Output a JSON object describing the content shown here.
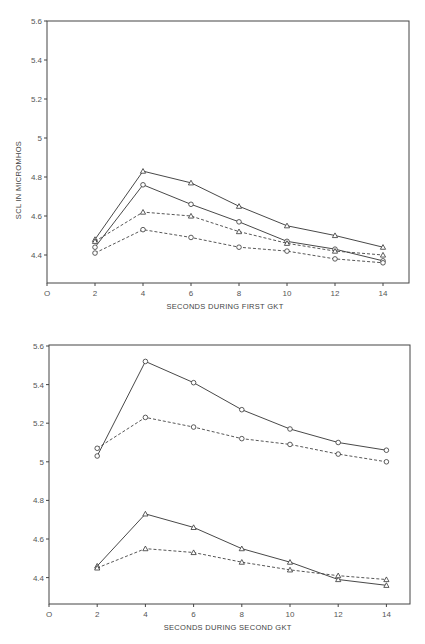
{
  "chart_data": [
    {
      "type": "line",
      "title": "",
      "xlabel": "SECONDS DURING FIRST GKT",
      "ylabel": "SCL IN MICROMHOS",
      "x": [
        2,
        4,
        6,
        8,
        10,
        12,
        14
      ],
      "xticks": [
        0,
        2,
        4,
        6,
        8,
        10,
        12,
        14
      ],
      "xtick_labels": [
        "O",
        "2",
        "4",
        "6",
        "8",
        "10",
        "12",
        "14"
      ],
      "yticks": [
        4.4,
        4.6,
        4.8,
        5.0,
        5.2,
        5.4,
        5.6
      ],
      "ytick_labels": [
        "4.4",
        "4.6",
        "4.8",
        "5",
        "5.2",
        "5.4",
        "5.6"
      ],
      "xlim": [
        0,
        15
      ],
      "ylim": [
        4.26,
        5.6
      ],
      "grid": false,
      "legend": null,
      "series": [
        {
          "name": "solid-triangle",
          "line": "solid",
          "marker": "triangle",
          "values": [
            4.48,
            4.83,
            4.77,
            4.65,
            4.55,
            4.5,
            4.44
          ]
        },
        {
          "name": "solid-circle",
          "line": "solid",
          "marker": "circle",
          "values": [
            4.44,
            4.76,
            4.66,
            4.57,
            4.47,
            4.43,
            4.37
          ]
        },
        {
          "name": "dashed-triangle",
          "line": "dashed",
          "marker": "triangle",
          "values": [
            4.47,
            4.62,
            4.6,
            4.52,
            4.46,
            4.42,
            4.4
          ]
        },
        {
          "name": "dashed-circle",
          "line": "dashed",
          "marker": "circle",
          "values": [
            4.41,
            4.53,
            4.49,
            4.44,
            4.42,
            4.38,
            4.36
          ]
        }
      ]
    },
    {
      "type": "line",
      "title": "",
      "xlabel": "SECONDS DURING SECOND GKT",
      "ylabel": "",
      "x": [
        2,
        4,
        6,
        8,
        10,
        12,
        14
      ],
      "xticks": [
        0,
        2,
        4,
        6,
        8,
        10,
        12,
        14
      ],
      "xtick_labels": [
        "O",
        "2",
        "4",
        "6",
        "8",
        "10",
        "12",
        "14"
      ],
      "yticks": [
        4.4,
        4.6,
        4.8,
        5.0,
        5.2,
        5.4,
        5.6
      ],
      "ytick_labels": [
        "4.4",
        "4.6",
        "4.8",
        "5",
        "5.2",
        "5.4",
        "5.6"
      ],
      "xlim": [
        0,
        15
      ],
      "ylim": [
        4.26,
        5.6
      ],
      "grid": false,
      "legend": null,
      "series": [
        {
          "name": "solid-circle",
          "line": "solid",
          "marker": "circle",
          "values": [
            5.03,
            5.52,
            5.41,
            5.27,
            5.17,
            5.1,
            5.06
          ]
        },
        {
          "name": "dashed-circle",
          "line": "dashed",
          "marker": "circle",
          "values": [
            5.07,
            5.23,
            5.18,
            5.12,
            5.09,
            5.04,
            5.0
          ]
        },
        {
          "name": "solid-triangle",
          "line": "solid",
          "marker": "triangle",
          "values": [
            4.46,
            4.73,
            4.66,
            4.55,
            4.48,
            4.39,
            4.36
          ]
        },
        {
          "name": "dashed-triangle",
          "line": "dashed",
          "marker": "triangle",
          "values": [
            4.45,
            4.55,
            4.53,
            4.48,
            4.44,
            4.41,
            4.39
          ]
        }
      ]
    }
  ],
  "layout": [
    {
      "left": 47,
      "right": 409,
      "top": 21,
      "bottom": 283,
      "xscale": 24.0,
      "y_at_56": 21,
      "yscale": 195
    },
    {
      "left": 49,
      "right": 410,
      "top": 345,
      "bottom": 604,
      "xscale": 24.1,
      "y_at_56": 346,
      "yscale": 193
    }
  ]
}
